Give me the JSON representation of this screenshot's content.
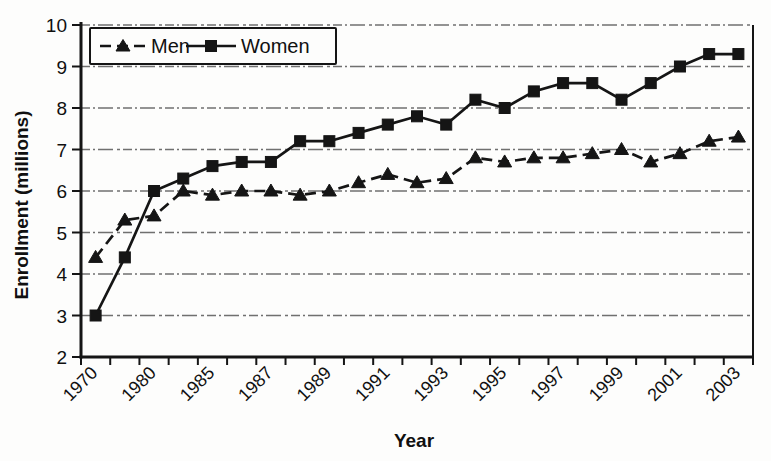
{
  "colors": {
    "ink": "#151515",
    "background": "#fdfdfc"
  },
  "chart_data": {
    "type": "line",
    "title": "",
    "xlabel": "Year",
    "ylabel": "Enrollment (millions)",
    "ylim": [
      2,
      10
    ],
    "y_ticks": [
      2,
      3,
      4,
      5,
      6,
      7,
      8,
      9,
      10
    ],
    "grid": "horizontal-dashed",
    "legend_position": "top-left-inside",
    "x_tick_labels_visible": [
      "1970",
      "1980",
      "1985",
      "1987",
      "1989",
      "1991",
      "1993",
      "1995",
      "1997",
      "1999",
      "2001",
      "2003"
    ],
    "categories": [
      "1970",
      "",
      "1980",
      "",
      "1985",
      "",
      "1987",
      "",
      "1989",
      "",
      "1991",
      "",
      "1993",
      "",
      "1995",
      "",
      "1997",
      "",
      "1999",
      "",
      "2001",
      "",
      "2003"
    ],
    "series": [
      {
        "name": "Men",
        "marker": "triangle",
        "line_style": "dashed",
        "color": "#151515",
        "values": [
          4.4,
          5.3,
          5.4,
          6.0,
          5.9,
          6.0,
          6.0,
          5.9,
          6.0,
          6.2,
          6.4,
          6.2,
          6.3,
          6.8,
          6.7,
          6.8,
          6.8,
          6.9,
          7.0,
          6.7,
          6.9,
          7.2,
          7.3
        ]
      },
      {
        "name": "Women",
        "marker": "square",
        "line_style": "solid",
        "color": "#151515",
        "values": [
          3.0,
          4.4,
          6.0,
          6.3,
          6.6,
          6.7,
          6.7,
          7.2,
          7.2,
          7.4,
          7.6,
          7.8,
          7.6,
          8.2,
          8.0,
          8.4,
          8.6,
          8.6,
          8.2,
          8.6,
          9.0,
          9.3,
          9.3
        ]
      }
    ]
  }
}
